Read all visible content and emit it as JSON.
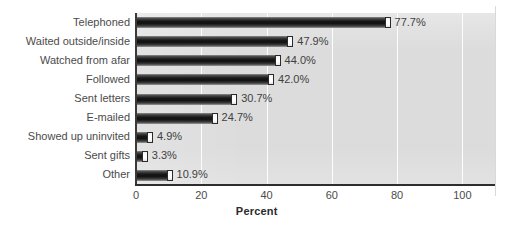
{
  "chart_data": {
    "type": "bar",
    "orientation": "horizontal",
    "title": "",
    "xlabel": "Percent",
    "ylabel": "",
    "xlim": [
      0,
      110
    ],
    "xticks": [
      0,
      20,
      40,
      60,
      80,
      100
    ],
    "xtick_labels": [
      "0",
      "20",
      "40",
      "60",
      "80",
      "100"
    ],
    "grid": "vertical-white-gridlines",
    "legend": "none",
    "categories": [
      "Telephoned",
      "Waited outside/inside",
      "Watched from afar",
      "Followed",
      "Sent letters",
      "E-mailed",
      "Showed up uninvited",
      "Sent gifts",
      "Other"
    ],
    "values": [
      77.7,
      47.9,
      44.0,
      42.0,
      30.7,
      24.7,
      4.9,
      3.3,
      10.9
    ],
    "data_labels": [
      "77.7%",
      "47.9%",
      "44.0%",
      "42.0%",
      "30.7%",
      "24.7%",
      "4.9%",
      "3.3%",
      "10.9%"
    ],
    "colors": {
      "bar_dark": "#151515",
      "bar_highlight": "#9a9a9a",
      "plot_background": "#dcdcdc",
      "gridline": "#fdfdfd",
      "axis": "#2e2e2e",
      "text": "#4b4b4b"
    }
  }
}
